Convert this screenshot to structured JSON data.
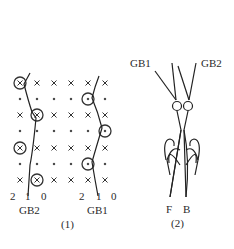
{
  "figure": {
    "part1": {
      "caption": "(1)",
      "grid": {
        "columns_x": [
          20,
          37,
          54,
          71,
          88,
          105
        ],
        "rows": [
          {
            "y": 83,
            "type": "cross",
            "circled_cols": [
              0
            ]
          },
          {
            "y": 99,
            "type": "dot",
            "circled_cols": [
              4
            ]
          },
          {
            "y": 115,
            "type": "cross",
            "circled_cols": [
              1
            ]
          },
          {
            "y": 131,
            "type": "dot",
            "circled_cols": [
              5
            ]
          },
          {
            "y": 148,
            "type": "cross",
            "circled_cols": [
              0
            ]
          },
          {
            "y": 164,
            "type": "dot",
            "circled_cols": [
              4
            ]
          },
          {
            "y": 180,
            "type": "cross",
            "circled_cols": [
              1
            ]
          }
        ]
      },
      "axis_labels_left": [
        "2",
        "1",
        "0"
      ],
      "axis_labels_right": [
        "2",
        "1",
        "0"
      ],
      "wire_left_label": "GB2",
      "wire_right_label": "GB1"
    },
    "part2": {
      "caption": "(2)",
      "top_left_label": "GB1",
      "top_right_label": "GB2",
      "bottom_left_label": "F",
      "bottom_right_label": "B"
    }
  }
}
